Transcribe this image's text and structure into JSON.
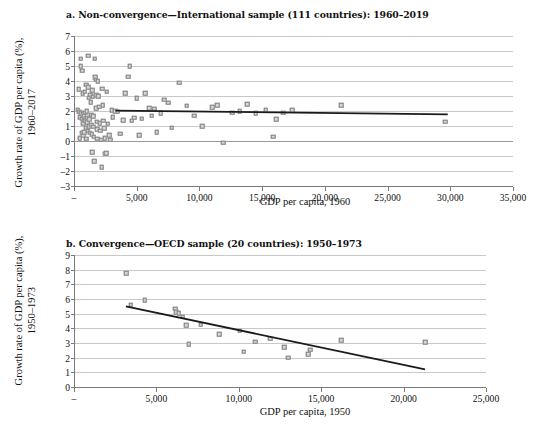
{
  "figure": {
    "panels": [
      {
        "id": "a",
        "title": "a. Non-convergence—International sample (111 countries): 1960–2019",
        "ylabel_line1": "Growth rate of GDP per capita (%),",
        "ylabel_line2": "1960–2017",
        "xlabel": "GDP per capita, 1960"
      },
      {
        "id": "b",
        "title": "b. Convergence—OECD sample (20 countries): 1950–1973",
        "ylabel_line1": "Growth rate of GDP per capita (%),",
        "ylabel_line2": "1950–1973",
        "xlabel": "GDP per capita, 1950"
      }
    ]
  },
  "chart_data": [
    {
      "type": "scatter",
      "panel": "a",
      "title": "a. Non-convergence—International sample (111 countries): 1960–2019",
      "xlabel": "GDP per capita, 1960",
      "ylabel": "Growth rate of GDP per capita (%), 1960–2017",
      "xlim": [
        0,
        35000
      ],
      "ylim": [
        -3,
        7
      ],
      "xticks": [
        0,
        5000,
        10000,
        15000,
        20000,
        25000,
        30000,
        35000
      ],
      "xtick_labels": [
        "–",
        "5,000",
        "10,000",
        "15,000",
        "20,000",
        "25,000",
        "30,000",
        "35,000"
      ],
      "yticks": [
        -3,
        -2,
        -1,
        0,
        1,
        2,
        3,
        4,
        5,
        6,
        7
      ],
      "ytick_labels": [
        "–3",
        "–2",
        "–1",
        "0",
        "1",
        "2",
        "3",
        "4",
        "5",
        "6",
        "7"
      ],
      "grid": true,
      "legend": "none",
      "marker": "square",
      "marker_color": "#d6d6d6",
      "marker_edge_color": "#7d7d7d",
      "trendline": {
        "color": "#1a1a1a",
        "x": [
          3300,
          29800
        ],
        "y": [
          2.02,
          1.78
        ]
      },
      "points": [
        [
          300,
          2.1
        ],
        [
          380,
          3.45
        ],
        [
          420,
          1.95
        ],
        [
          450,
          1.6
        ],
        [
          470,
          0.2
        ],
        [
          520,
          5.5
        ],
        [
          540,
          5.0
        ],
        [
          560,
          1.85
        ],
        [
          600,
          1.5
        ],
        [
          610,
          0.55
        ],
        [
          650,
          4.7
        ],
        [
          680,
          3.2
        ],
        [
          700,
          1.8
        ],
        [
          720,
          1.2
        ],
        [
          740,
          0.35
        ],
        [
          780,
          1.7
        ],
        [
          800,
          1.4
        ],
        [
          820,
          0.6
        ],
        [
          850,
          3.3
        ],
        [
          880,
          1.9
        ],
        [
          900,
          1.35
        ],
        [
          920,
          0.9
        ],
        [
          950,
          0.15
        ],
        [
          980,
          3.75
        ],
        [
          1000,
          2.0
        ],
        [
          1030,
          1.55
        ],
        [
          1060,
          1.25
        ],
        [
          1090,
          0.7
        ],
        [
          1120,
          5.7
        ],
        [
          1150,
          3.6
        ],
        [
          1180,
          2.9
        ],
        [
          1200,
          1.45
        ],
        [
          1230,
          1.0
        ],
        [
          1260,
          0.55
        ],
        [
          1290,
          3.1
        ],
        [
          1320,
          2.6
        ],
        [
          1350,
          1.75
        ],
        [
          1380,
          1.1
        ],
        [
          1400,
          0.45
        ],
        [
          1430,
          -0.75
        ],
        [
          1460,
          3.4
        ],
        [
          1490,
          2.95
        ],
        [
          1520,
          1.65
        ],
        [
          1550,
          0.95
        ],
        [
          1580,
          0.3
        ],
        [
          1600,
          -1.35
        ],
        [
          1650,
          5.5
        ],
        [
          1700,
          4.25
        ],
        [
          1720,
          4.1
        ],
        [
          1750,
          3.05
        ],
        [
          1780,
          2.2
        ],
        [
          1800,
          1.3
        ],
        [
          1830,
          0.8
        ],
        [
          1860,
          0.15
        ],
        [
          1900,
          4.0
        ],
        [
          1950,
          3.0
        ],
        [
          2000,
          2.3
        ],
        [
          2050,
          1.2
        ],
        [
          2100,
          0.7
        ],
        [
          2150,
          0.1
        ],
        [
          2200,
          -1.75
        ],
        [
          2250,
          3.5
        ],
        [
          2300,
          2.4
        ],
        [
          2350,
          1.35
        ],
        [
          2400,
          0.85
        ],
        [
          2450,
          0.2
        ],
        [
          2500,
          -0.85
        ],
        [
          2550,
          -0.8
        ],
        [
          2600,
          3.3
        ],
        [
          2700,
          1.15
        ],
        [
          2800,
          0.4
        ],
        [
          2900,
          0.1
        ],
        [
          3000,
          2.05
        ],
        [
          3100,
          1.6
        ],
        [
          3300,
          2.0
        ],
        [
          3500,
          1.95
        ],
        [
          3700,
          0.5
        ],
        [
          3900,
          1.4
        ],
        [
          4100,
          3.2
        ],
        [
          4300,
          4.3
        ],
        [
          4450,
          5.0
        ],
        [
          4600,
          1.35
        ],
        [
          4800,
          1.55
        ],
        [
          5000,
          2.85
        ],
        [
          5200,
          0.4
        ],
        [
          5400,
          1.5
        ],
        [
          5700,
          3.2
        ],
        [
          6000,
          2.2
        ],
        [
          6200,
          1.7
        ],
        [
          6400,
          2.15
        ],
        [
          6600,
          0.6
        ],
        [
          6900,
          1.85
        ],
        [
          7200,
          2.75
        ],
        [
          7500,
          2.55
        ],
        [
          7800,
          0.9
        ],
        [
          8400,
          3.9
        ],
        [
          9000,
          2.35
        ],
        [
          9600,
          1.7
        ],
        [
          10200,
          1.0
        ],
        [
          11000,
          2.25
        ],
        [
          11400,
          2.4
        ],
        [
          11900,
          -0.1
        ],
        [
          12600,
          1.9
        ],
        [
          13200,
          2.0
        ],
        [
          13800,
          2.45
        ],
        [
          14500,
          1.85
        ],
        [
          15300,
          2.05
        ],
        [
          15900,
          0.3
        ],
        [
          16100,
          1.45
        ],
        [
          16700,
          1.9
        ],
        [
          17400,
          2.05
        ],
        [
          21300,
          2.4
        ],
        [
          29600,
          1.3
        ]
      ]
    },
    {
      "type": "scatter",
      "panel": "b",
      "title": "b. Convergence—OECD sample (20 countries): 1950–1973",
      "xlabel": "GDP per capita, 1950",
      "ylabel": "Growth rate of GDP per capita (%), 1950–1973",
      "xlim": [
        0,
        25000
      ],
      "ylim": [
        0,
        9
      ],
      "xticks": [
        0,
        5000,
        10000,
        15000,
        20000,
        25000
      ],
      "xtick_labels": [
        "–",
        "5,000",
        "10,000",
        "15,000",
        "20,000",
        "25,000"
      ],
      "yticks": [
        0,
        1,
        2,
        3,
        4,
        5,
        6,
        7,
        8,
        9
      ],
      "ytick_labels": [
        "0",
        "1",
        "2",
        "3",
        "4",
        "5",
        "6",
        "7",
        "8",
        "9"
      ],
      "grid": true,
      "legend": "none",
      "marker": "square",
      "marker_color": "#d6d6d6",
      "marker_edge_color": "#7d7d7d",
      "trendline": {
        "color": "#1a1a1a",
        "x": [
          3150,
          21300
        ],
        "y": [
          5.5,
          1.2
        ]
      },
      "points": [
        [
          3150,
          7.75
        ],
        [
          3450,
          5.6
        ],
        [
          4300,
          5.9
        ],
        [
          6150,
          5.35
        ],
        [
          6200,
          5.1
        ],
        [
          6350,
          5.05
        ],
        [
          6600,
          4.8
        ],
        [
          6800,
          4.2
        ],
        [
          6950,
          2.9
        ],
        [
          7700,
          4.25
        ],
        [
          8800,
          3.6
        ],
        [
          10050,
          3.85
        ],
        [
          10300,
          2.4
        ],
        [
          11000,
          3.1
        ],
        [
          11900,
          3.3
        ],
        [
          12750,
          2.7
        ],
        [
          13000,
          2.0
        ],
        [
          14200,
          2.25
        ],
        [
          14350,
          2.55
        ],
        [
          16200,
          3.2
        ],
        [
          21300,
          3.05
        ]
      ]
    }
  ]
}
